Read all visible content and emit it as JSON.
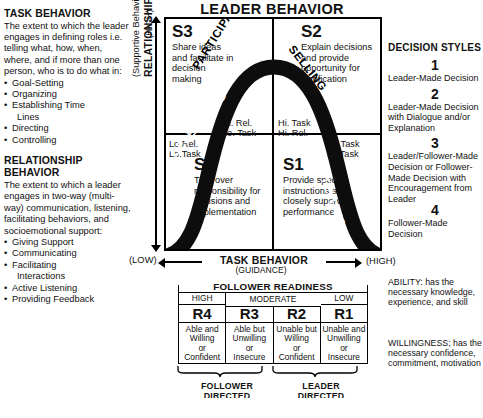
{
  "title": "LEADER BEHAVIOR",
  "left_panel": {
    "task_behavior": {
      "heading": "TASK BEHAVIOR",
      "body": "The  extent to which the leader engages in defining roles i.e. telling what, how, when, where, and if more than one person, who is to do what in:",
      "bullets": [
        "Goal-Setting",
        "Organizing",
        "Establishing Time",
        "Directing",
        "Controlling"
      ],
      "bullet_continuation": "Lines"
    },
    "relationship_behavior": {
      "heading_line1": "RELATIONSHIP",
      "heading_line2": "BEHAVIOR",
      "body": "The extent to which a leader engages in two-way (multi-way) communication, listening, facilitating behaviors, and socioemotional support:",
      "bullets": [
        "Giving Support",
        "Communicating",
        "Facilitating",
        "Active Listening",
        "Providing Feedback"
      ],
      "bullet_continuation": "Interactions"
    }
  },
  "y_axis": {
    "high": "(HIGH)",
    "low": "(LOW)",
    "main_label": "RELATIONSHIP BEHAVIOR",
    "sub_label": "(Supportive Behavior)"
  },
  "x_axis": {
    "title": "TASK BEHAVIOR",
    "sub": "(GUIDANCE)",
    "high": "(HIGH)"
  },
  "quadrants": {
    "s3": {
      "code": "S3",
      "desc": "Share ideas and facilitate in decision making",
      "curve_word": "PARTICIPATING",
      "mini": "Hi. Rel.\nLo. Task"
    },
    "s2": {
      "code": "S2",
      "desc": "Explain decisions and provide opportunity for clarification",
      "curve_word": "SELLING",
      "mini": "Hi. Task\nHi. Rel."
    },
    "s4": {
      "code": "S4",
      "desc": "Turn over responsibility for decisions and implementation",
      "curve_word": "DELEGATING",
      "mini": "Lo.Rel.\nLo.Task"
    },
    "s1": {
      "code": "S1",
      "desc": "Provide specific instructions and closely supervise performance",
      "curve_word": "TELLING",
      "mini": "Hi. Task\nLo.Task"
    }
  },
  "decision_styles": {
    "title": "DECISION STYLES",
    "items": [
      {
        "num": "1",
        "text": "Leader-Made Decision"
      },
      {
        "num": "2",
        "text": "Leader-Made Decision with Dialogue and/or Explanation"
      },
      {
        "num": "3",
        "text": "Leader/Follower-Made Decision or Follower-Made Decision with Encouragement from Leader"
      },
      {
        "num": "4",
        "text": "Follower-Made Decision"
      }
    ]
  },
  "follower_readiness": {
    "title": "FOLLOWER READINESS",
    "levels": [
      {
        "header": "HIGH",
        "code": "R4",
        "desc": "Able and\nWilling\nor\nConfident"
      },
      {
        "header": "MODERATE",
        "code": "R3",
        "desc": "Able but\nUnwilling\nor\nInsecure"
      },
      {
        "header": "",
        "code": "R2",
        "desc": "Unable but\nWilling\nor\nConfident"
      },
      {
        "header": "LOW",
        "code": "R1",
        "desc": "Unable and\nUnwilling\nor\nInsecure"
      }
    ],
    "moderate_header": "MODERATE",
    "braces": [
      {
        "label": "FOLLOWER\nDIRECTED"
      },
      {
        "label": "LEADER\nDIRECTED"
      }
    ]
  },
  "definitions": {
    "ability": "ABILITY: has the necessary knowledge, experience, and skill",
    "willingness": "WILLINGNESS; has the necessary confidence, commitment, motivation"
  },
  "colors": {
    "ink": "#111111",
    "curve": "#0d0d0d",
    "background": "#ffffff"
  }
}
